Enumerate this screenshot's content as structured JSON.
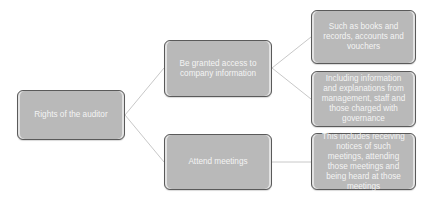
{
  "diagram": {
    "type": "tree",
    "colors": {
      "node_fill": "#b9b9b9",
      "node_border": "#5a5a5a",
      "node_text": "#f4f4f4",
      "connector": "#c8c8c8"
    },
    "root": {
      "label": "Rights of the auditor"
    },
    "children": [
      {
        "label": "Be granted access to company information",
        "children": [
          {
            "label": "Such as books and records, accounts and vouchers"
          },
          {
            "label": "Including information and explanations from management, staff and those charged with governance"
          }
        ]
      },
      {
        "label": "Attend meetings",
        "children": [
          {
            "label": "This includes receiving notices of such meetings, attending those meetings and being heard at those meetings"
          }
        ]
      }
    ]
  }
}
